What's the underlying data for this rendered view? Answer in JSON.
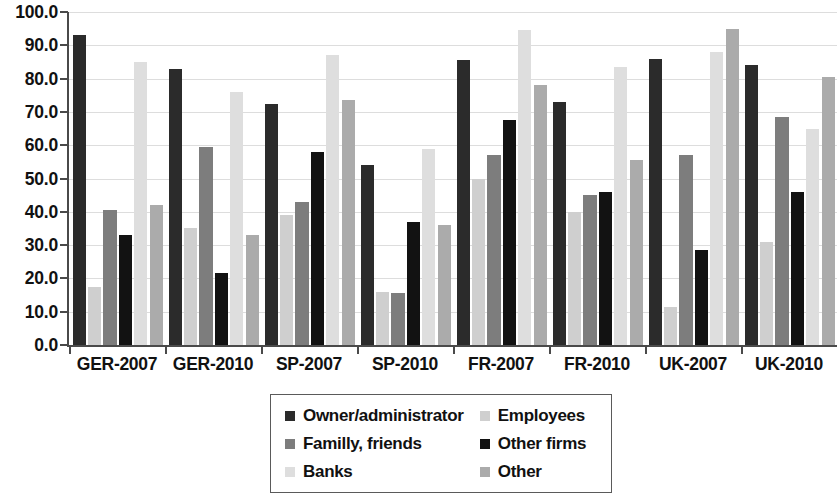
{
  "chart_data": {
    "type": "bar",
    "title": "",
    "subtitle": "",
    "xlabel": "",
    "ylabel": "",
    "grid": true,
    "legend_position": "bottom-center",
    "ylim": [
      0,
      100
    ],
    "ytick_step": 10,
    "ytick_labels": [
      "100.0",
      "90.0",
      "80.0",
      "70.0",
      "60.0",
      "50.0",
      "40.0",
      "30.0",
      "20.0",
      "10.0",
      "0.0"
    ],
    "ytick_values": [
      100,
      90,
      80,
      70,
      60,
      50,
      40,
      30,
      20,
      10,
      0
    ],
    "categories": [
      "GER-2007",
      "GER-2010",
      "SP-2007",
      "SP-2010",
      "FR-2007",
      "FR-2010",
      "UK-2007",
      "UK-2010"
    ],
    "series": [
      {
        "name": "Owner/administrator",
        "color": "#2b2b2b",
        "values": [
          93.0,
          83.0,
          72.5,
          54.0,
          85.5,
          73.0,
          86.0,
          84.0
        ]
      },
      {
        "name": "Employees",
        "color": "#cfcfcf",
        "values": [
          17.5,
          35.0,
          39.0,
          16.0,
          50.0,
          40.0,
          11.5,
          31.0
        ]
      },
      {
        "name": "Familly, friends",
        "color": "#7d7d7d",
        "values": [
          40.5,
          59.5,
          43.0,
          15.5,
          57.0,
          45.0,
          57.0,
          68.5
        ]
      },
      {
        "name": "Other firms",
        "color": "#121212",
        "values": [
          33.0,
          21.5,
          58.0,
          37.0,
          67.5,
          46.0,
          28.5,
          46.0
        ]
      },
      {
        "name": "Banks",
        "color": "#dedede",
        "values": [
          85.0,
          76.0,
          87.0,
          59.0,
          94.5,
          83.5,
          88.0,
          65.0
        ]
      },
      {
        "name": "Other",
        "color": "#ababab",
        "values": [
          42.0,
          33.0,
          73.5,
          36.0,
          78.0,
          55.5,
          95.0,
          80.5
        ]
      }
    ]
  },
  "legend": {
    "rows": [
      [
        {
          "label": "Owner/administrator",
          "color": "#2b2b2b"
        },
        {
          "label": "Employees",
          "color": "#cfcfcf"
        }
      ],
      [
        {
          "label": "Familly, friends",
          "color": "#7d7d7d"
        },
        {
          "label": "Other firms",
          "color": "#121212"
        }
      ],
      [
        {
          "label": "Banks",
          "color": "#dedede"
        },
        {
          "label": "Other",
          "color": "#ababab"
        }
      ]
    ]
  }
}
